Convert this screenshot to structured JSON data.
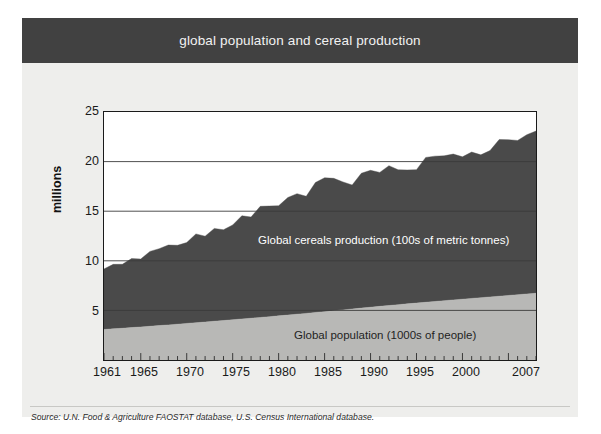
{
  "figure": {
    "title": "global population and cereal production",
    "source": "Source: U.N. Food & Agriculture FAOSTAT database, U.S. Census International database.",
    "colors": {
      "title_band": "#414141",
      "title_text": "#f2f2f2",
      "panel_background": "#eeeeec",
      "plot_background": "#ffffff",
      "cereals_fill": "#4a4a4a",
      "population_fill": "#b8b8b6",
      "axis": "#1a1a1a",
      "gridline": "#8c8c8c"
    }
  },
  "axes": {
    "ylabel": "millions",
    "yticks": [
      "5",
      "10",
      "15",
      "20",
      "25"
    ],
    "xticks": [
      "1961",
      "1965",
      "1970",
      "1975",
      "1980",
      "1985",
      "1990",
      "1995",
      "2000",
      "2007"
    ]
  },
  "annotations": {
    "cereals": "Global cereals production (100s of metric tonnes)",
    "population": "Global population (1000s of people)"
  },
  "chart_data": {
    "type": "area",
    "title": "global population and cereal production",
    "subtitle": "",
    "xlabel": "",
    "ylabel": "millions",
    "xlim": [
      1961,
      2008
    ],
    "ylim": [
      0,
      25
    ],
    "yticks": [
      5,
      10,
      15,
      20,
      25
    ],
    "xticks": [
      1961,
      1965,
      1970,
      1975,
      1980,
      1985,
      1990,
      1995,
      2000,
      2007
    ],
    "grid": "horizontal",
    "stacked": true,
    "legend": "inline-labels",
    "x": [
      1961,
      1962,
      1963,
      1964,
      1965,
      1966,
      1967,
      1968,
      1969,
      1970,
      1971,
      1972,
      1973,
      1974,
      1975,
      1976,
      1977,
      1978,
      1979,
      1980,
      1981,
      1982,
      1983,
      1984,
      1985,
      1986,
      1987,
      1988,
      1989,
      1990,
      1991,
      1992,
      1993,
      1994,
      1995,
      1996,
      1997,
      1998,
      1999,
      2000,
      2001,
      2002,
      2003,
      2004,
      2005,
      2006,
      2007,
      2008
    ],
    "series": [
      {
        "name": "Global population (1000s of people)",
        "units": "1000s of people",
        "color": "#b8b8b6",
        "values": [
          3.08,
          3.14,
          3.2,
          3.27,
          3.33,
          3.4,
          3.47,
          3.54,
          3.61,
          3.69,
          3.76,
          3.83,
          3.91,
          3.98,
          4.06,
          4.14,
          4.21,
          4.29,
          4.37,
          4.45,
          4.53,
          4.62,
          4.7,
          4.79,
          4.87,
          4.96,
          5.05,
          5.14,
          5.23,
          5.32,
          5.41,
          5.49,
          5.58,
          5.66,
          5.74,
          5.82,
          5.9,
          5.98,
          6.06,
          6.13,
          6.21,
          6.28,
          6.36,
          6.43,
          6.51,
          6.58,
          6.66,
          6.73
        ]
      },
      {
        "name": "Global cereals production (100s of metric tonnes)",
        "units": "100s of metric tonnes",
        "color": "#4a4a4a",
        "values": [
          6.1,
          6.5,
          6.45,
          6.95,
          6.85,
          7.55,
          7.75,
          8.05,
          7.95,
          8.15,
          8.95,
          8.65,
          9.35,
          9.15,
          9.55,
          10.4,
          10.2,
          11.2,
          11.15,
          11.1,
          11.85,
          12.15,
          11.8,
          13.1,
          13.5,
          13.35,
          12.9,
          12.5,
          13.6,
          13.8,
          13.5,
          14.1,
          13.6,
          13.5,
          13.45,
          14.6,
          14.65,
          14.6,
          14.7,
          14.35,
          14.75,
          14.4,
          14.75,
          15.8,
          15.7,
          15.55,
          16.05,
          16.35
        ]
      }
    ]
  }
}
